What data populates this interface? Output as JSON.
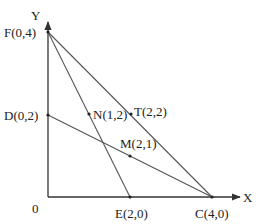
{
  "diagram": {
    "axes": {
      "x_label": "X",
      "y_label": "Y",
      "origin_label": "0"
    },
    "points": {
      "F": {
        "label": "F(0,4)",
        "x": 0,
        "y": 4
      },
      "D": {
        "label": "D(0,2)",
        "x": 0,
        "y": 2
      },
      "N": {
        "label": "N(1,2)",
        "x": 1,
        "y": 2
      },
      "T": {
        "label": "T(2,2)",
        "x": 2,
        "y": 2
      },
      "M": {
        "label": "M(2,1)",
        "x": 2,
        "y": 1
      },
      "E": {
        "label": "E(2,0)",
        "x": 2,
        "y": 0
      },
      "C": {
        "label": "C(4,0)",
        "x": 4,
        "y": 0
      }
    },
    "segments": [
      {
        "from": "F",
        "to": "C"
      },
      {
        "from": "F",
        "to": "E"
      },
      {
        "from": "D",
        "to": "C"
      }
    ],
    "colors": {
      "axis": "#333333",
      "line": "#555555",
      "text": "#222222"
    }
  }
}
